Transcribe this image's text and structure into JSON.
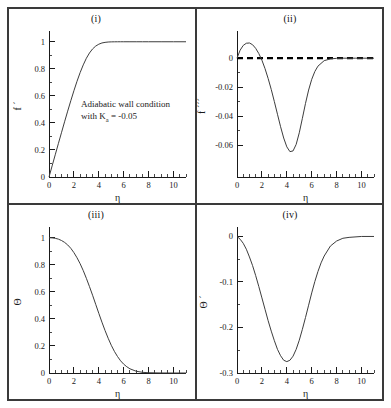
{
  "figure": {
    "annotation": {
      "line1": "Adiabatic wall condition",
      "line2_pre": "with K",
      "line2_sub": "a",
      "line2_post": " = -0.05"
    }
  },
  "panels": {
    "i": {
      "title": "(i)",
      "xlabel": "η",
      "ylabel": "f ´"
    },
    "ii": {
      "title": "(ii)",
      "xlabel": "η",
      "ylabel": "f ´´´"
    },
    "iii": {
      "title": "(iii)",
      "xlabel": "η",
      "ylabel": "Θ"
    },
    "iv": {
      "title": "(iv)",
      "xlabel": "η",
      "ylabel": "Θ ´"
    }
  },
  "axis_labels": {
    "x_ticks": [
      "0",
      "2",
      "4",
      "6",
      "8",
      "10"
    ],
    "y_ticks_i": [
      "0",
      "0.2",
      "0.4",
      "0.6",
      "0.8",
      "1"
    ],
    "y_ticks_ii": [
      "0",
      "-0.02",
      "-0.04",
      "-0.06"
    ],
    "y_ticks_iii": [
      "0",
      "0.2",
      "0.4",
      "0.6",
      "0.8",
      "1"
    ],
    "y_ticks_iv": [
      "0",
      "-0.1",
      "-0.2",
      "-0.3"
    ]
  },
  "chart_data": [
    {
      "type": "line",
      "title": "(i)",
      "xlabel": "η",
      "ylabel": "f ´",
      "xlim": [
        0,
        11
      ],
      "ylim": [
        0,
        1.05
      ],
      "xticks": [
        0,
        2,
        4,
        6,
        8,
        10
      ],
      "yticks": [
        0,
        0.2,
        0.4,
        0.6,
        0.8,
        1
      ],
      "grid": false,
      "legend": null,
      "annotation": "Adiabatic wall condition with K_a = -0.05",
      "series": [
        {
          "name": "f'",
          "x": [
            0,
            0.25,
            0.5,
            0.75,
            1.0,
            1.25,
            1.5,
            1.75,
            2.0,
            2.25,
            2.5,
            2.75,
            3.0,
            3.25,
            3.5,
            3.75,
            4.0,
            4.25,
            4.5,
            4.75,
            5.0,
            5.25,
            5.5,
            5.75,
            6.0,
            6.5,
            7.0,
            7.5,
            8.0,
            9.0,
            10.0,
            11.0
          ],
          "y": [
            0,
            0.082,
            0.164,
            0.246,
            0.327,
            0.408,
            0.487,
            0.564,
            0.638,
            0.708,
            0.772,
            0.829,
            0.878,
            0.917,
            0.947,
            0.968,
            0.982,
            0.991,
            0.9955,
            0.998,
            0.9992,
            0.9997,
            0.9999,
            1.0,
            1.0,
            1.0,
            1.0,
            1.0,
            1.0,
            1.0,
            1.0,
            1.0
          ]
        }
      ]
    },
    {
      "type": "line",
      "title": "(ii)",
      "xlabel": "η",
      "ylabel": "f ´´´",
      "xlim": [
        0,
        11
      ],
      "ylim": [
        -0.082,
        0.016
      ],
      "xticks": [
        0,
        2,
        4,
        6,
        8,
        10
      ],
      "yticks": [
        0,
        -0.02,
        -0.04,
        -0.06
      ],
      "grid": false,
      "legend": null,
      "reference_line": {
        "name": "zero-line",
        "y": 0,
        "style": "dashed"
      },
      "series": [
        {
          "name": "f'''",
          "x": [
            0,
            0.25,
            0.5,
            0.75,
            1.0,
            1.25,
            1.5,
            1.75,
            2.0,
            2.25,
            2.5,
            2.75,
            3.0,
            3.25,
            3.5,
            3.75,
            4.0,
            4.25,
            4.5,
            4.75,
            5.0,
            5.25,
            5.5,
            5.75,
            6.0,
            6.25,
            6.5,
            7.0,
            7.5,
            8.0,
            8.5,
            9.0,
            9.5,
            10.0,
            11.0
          ],
          "y": [
            0.0,
            0.0055,
            0.0088,
            0.0103,
            0.0105,
            0.0093,
            0.0068,
            0.0032,
            -0.0014,
            -0.0072,
            -0.014,
            -0.0216,
            -0.03,
            -0.0387,
            -0.0473,
            -0.0551,
            -0.0612,
            -0.0645,
            -0.064,
            -0.0595,
            -0.0515,
            -0.0415,
            -0.0312,
            -0.022,
            -0.0146,
            -0.0092,
            -0.0055,
            -0.0017,
            -0.0005,
            -0.0001,
            0.0,
            0.0,
            0.0,
            0.0,
            0.0
          ]
        }
      ]
    },
    {
      "type": "line",
      "title": "(iii)",
      "xlabel": "η",
      "ylabel": "Θ",
      "xlim": [
        0,
        11
      ],
      "ylim": [
        0,
        1.05
      ],
      "xticks": [
        0,
        2,
        4,
        6,
        8,
        10
      ],
      "yticks": [
        0,
        0.2,
        0.4,
        0.6,
        0.8,
        1
      ],
      "grid": false,
      "legend": null,
      "series": [
        {
          "name": "Theta",
          "x": [
            0,
            0.25,
            0.5,
            0.75,
            1.0,
            1.25,
            1.5,
            1.75,
            2.0,
            2.25,
            2.5,
            2.75,
            3.0,
            3.25,
            3.5,
            3.75,
            4.0,
            4.25,
            4.5,
            4.75,
            5.0,
            5.25,
            5.5,
            5.75,
            6.0,
            6.25,
            6.5,
            7.0,
            7.5,
            8.0,
            9.0,
            10.0,
            11.0
          ],
          "y": [
            1.0,
            0.999,
            0.996,
            0.99,
            0.98,
            0.966,
            0.947,
            0.922,
            0.89,
            0.852,
            0.808,
            0.757,
            0.7,
            0.639,
            0.575,
            0.508,
            0.441,
            0.376,
            0.314,
            0.257,
            0.205,
            0.16,
            0.122,
            0.09,
            0.065,
            0.046,
            0.031,
            0.013,
            0.005,
            0.002,
            0.0003,
            0.0,
            0.0
          ]
        }
      ]
    },
    {
      "type": "line",
      "title": "(iv)",
      "xlabel": "η",
      "ylabel": "Θ ´",
      "xlim": [
        0,
        11
      ],
      "ylim": [
        -0.3,
        0.012
      ],
      "xticks": [
        0,
        2,
        4,
        6,
        8,
        10
      ],
      "yticks": [
        0,
        -0.1,
        -0.2,
        -0.3
      ],
      "grid": false,
      "legend": null,
      "series": [
        {
          "name": "Theta'",
          "x": [
            0,
            0.25,
            0.5,
            0.75,
            1.0,
            1.25,
            1.5,
            1.75,
            2.0,
            2.25,
            2.5,
            2.75,
            3.0,
            3.25,
            3.5,
            3.75,
            4.0,
            4.25,
            4.5,
            4.75,
            5.0,
            5.25,
            5.5,
            5.75,
            6.0,
            6.25,
            6.5,
            6.75,
            7.0,
            7.5,
            8.0,
            8.5,
            9.0,
            10.0,
            11.0
          ],
          "y": [
            0.0,
            -0.006,
            -0.015,
            -0.028,
            -0.045,
            -0.064,
            -0.086,
            -0.11,
            -0.135,
            -0.16,
            -0.185,
            -0.208,
            -0.229,
            -0.248,
            -0.262,
            -0.272,
            -0.275,
            -0.272,
            -0.263,
            -0.248,
            -0.228,
            -0.204,
            -0.178,
            -0.151,
            -0.124,
            -0.099,
            -0.077,
            -0.058,
            -0.043,
            -0.021,
            -0.01,
            -0.004,
            -0.002,
            0.0,
            0.0
          ]
        }
      ]
    }
  ]
}
